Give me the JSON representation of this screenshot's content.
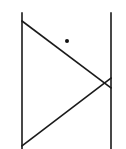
{
  "canvas": {
    "width": 126,
    "height": 149,
    "background": "#ffffff"
  },
  "stroke": {
    "color": "#1a1a1a",
    "width": 1.6
  },
  "lines": [
    {
      "id": "left-vertical",
      "x1": 22,
      "y1": 13,
      "x2": 22,
      "y2": 149
    },
    {
      "id": "right-vertical",
      "x1": 111,
      "y1": 13,
      "x2": 111,
      "y2": 149
    },
    {
      "id": "upper-diagonal",
      "x1": 22,
      "y1": 21,
      "x2": 111,
      "y2": 88
    },
    {
      "id": "lower-diagonal",
      "x1": 22,
      "y1": 146,
      "x2": 111,
      "y2": 78
    }
  ],
  "points": [
    {
      "id": "dot",
      "cx": 67,
      "cy": 41,
      "r": 2,
      "fill": "#111111"
    }
  ]
}
